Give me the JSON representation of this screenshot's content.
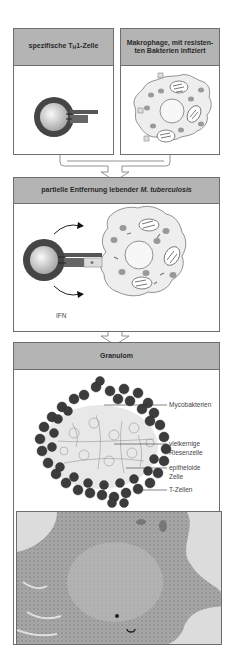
{
  "panels": {
    "th1_cell": {
      "title_prefix": "spezifische T",
      "title_sub": "H",
      "title_suffix": "1-Zelle"
    },
    "macrophage": {
      "title": "Makrophage, mit resisten-ten Bakterien infiziert",
      "title_line1": "Makrophage, mit resisten-",
      "title_line2": "ten Bakterien infiziert"
    },
    "removal": {
      "title_prefix": "partielle Entfernung lebender ",
      "title_italic": "M. tuberculosis",
      "ifn_label": "IFN"
    },
    "granuloma": {
      "title": "Granulom",
      "labels": {
        "mycobacteria": "Mycobakterien",
        "giant_cell_1": "vielkernige",
        "giant_cell_2": "Riesenzelle",
        "epithelioid_1": "epitheloide",
        "epithelioid_2": "Zelle",
        "t_cells": "T-Zellen"
      }
    },
    "histology": {
      "description": "Histologischer Schnitt eines Granuloms"
    }
  },
  "colors": {
    "header_bg": "#b4b4b4",
    "border": "#6e6e6e",
    "t_cell_dark": "#3c3c3c",
    "cytoplasm": "#eeeeee",
    "organelle": "#9a9a9a"
  }
}
